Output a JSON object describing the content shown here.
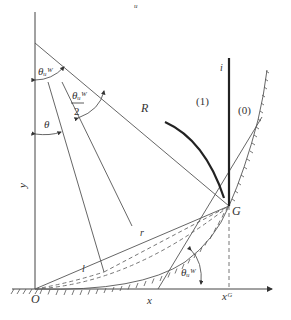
{
  "diagram": {
    "title_fragment": "u",
    "points": {
      "origin": "O",
      "contact_point": "G"
    },
    "axes": {
      "x_label": "x",
      "y_label": "y",
      "x_tick_label": "xᴳ"
    },
    "segments": {
      "radius": "R",
      "chord_r": "r",
      "chord_l": "l",
      "interface": "i"
    },
    "angles": {
      "theta_w_top": "θᵤᵂ",
      "theta_w_half_num": "θᵤᵂ",
      "theta_w_half_den": "2",
      "theta": "θ",
      "theta_w_bottom": "θᵤᵂ"
    },
    "regions": {
      "phase_1": "(1)",
      "phase_0": "(0)"
    },
    "colors": {
      "line": "#555555",
      "thick_line": "#222222",
      "background": "#ffffff"
    }
  }
}
